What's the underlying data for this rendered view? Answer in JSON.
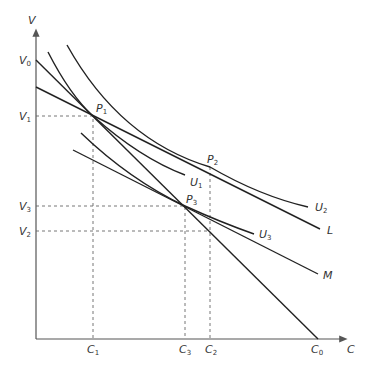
{
  "diagram": {
    "type": "economics-indifference-curve-diagram",
    "axes": {
      "x_label": "C",
      "y_label": "V"
    },
    "y_ticks": [
      {
        "id": "V0",
        "base": "V",
        "sub": "0"
      },
      {
        "id": "V1",
        "base": "V",
        "sub": "1"
      },
      {
        "id": "V3",
        "base": "V",
        "sub": "3"
      },
      {
        "id": "V2",
        "base": "V",
        "sub": "2"
      }
    ],
    "x_ticks": [
      {
        "id": "C1",
        "base": "C",
        "sub": "1"
      },
      {
        "id": "C3",
        "base": "C",
        "sub": "3"
      },
      {
        "id": "C2",
        "base": "C",
        "sub": "2"
      },
      {
        "id": "C0",
        "base": "C",
        "sub": "0"
      }
    ],
    "points": [
      {
        "id": "P1",
        "base": "P",
        "sub": "1"
      },
      {
        "id": "P2",
        "base": "P",
        "sub": "2"
      },
      {
        "id": "P3",
        "base": "P",
        "sub": "3"
      }
    ],
    "curves": [
      {
        "id": "U1",
        "base": "U",
        "sub": "1",
        "kind": "indifference-curve"
      },
      {
        "id": "U2",
        "base": "U",
        "sub": "2",
        "kind": "indifference-curve"
      },
      {
        "id": "U3",
        "base": "U",
        "sub": "3",
        "kind": "indifference-curve"
      }
    ],
    "lines": [
      {
        "id": "L",
        "label": "L",
        "kind": "budget-line"
      },
      {
        "id": "M",
        "label": "M",
        "kind": "budget-line"
      },
      {
        "id": "V0C0",
        "label": "",
        "kind": "budget-line from V0 to C0"
      }
    ]
  }
}
